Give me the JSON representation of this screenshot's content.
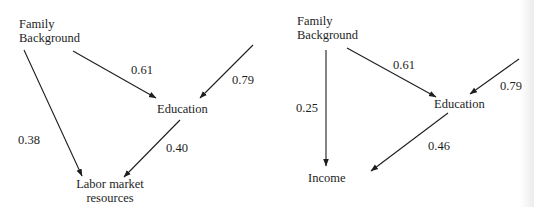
{
  "diagrams": [
    {
      "id": "left",
      "nodes": {
        "family_background": {
          "line1": "Family",
          "line2": "Background"
        },
        "education": {
          "label": "Education"
        },
        "outcome": {
          "line1": "Labor market",
          "line2": "resources"
        }
      },
      "paths": {
        "family_to_education": "0.61",
        "residual_to_education": "0.79",
        "family_to_outcome": "0.38",
        "education_to_outcome": "0.40"
      }
    },
    {
      "id": "right",
      "nodes": {
        "family_background": {
          "line1": "Family",
          "line2": "Background"
        },
        "education": {
          "label": "Education"
        },
        "outcome": {
          "label": "Income"
        }
      },
      "paths": {
        "family_to_education": "0.61",
        "residual_to_education": "0.79",
        "family_to_outcome": "0.25",
        "education_to_outcome": "0.46"
      }
    }
  ],
  "colors": {
    "ink": "#1e1e1e",
    "background": "#ffffff"
  }
}
